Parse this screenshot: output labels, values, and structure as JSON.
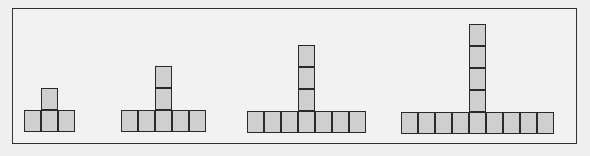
{
  "diagram": {
    "cell_fill": "#cfcfcf",
    "cell_border": "#2a2a2a",
    "figures": [
      {
        "step": 1,
        "base_cells": 3,
        "column_cells_above": 1,
        "base_left": 24,
        "base_top": 110,
        "column_index": 1
      },
      {
        "step": 2,
        "base_cells": 5,
        "column_cells_above": 2,
        "base_left": 121,
        "base_top": 110,
        "column_index": 2
      },
      {
        "step": 3,
        "base_cells": 7,
        "column_cells_above": 3,
        "base_left": 247,
        "base_top": 111,
        "column_index": 3
      },
      {
        "step": 4,
        "base_cells": 9,
        "column_cells_above": 4,
        "base_left": 401,
        "base_top": 112,
        "column_index": 4
      }
    ]
  }
}
